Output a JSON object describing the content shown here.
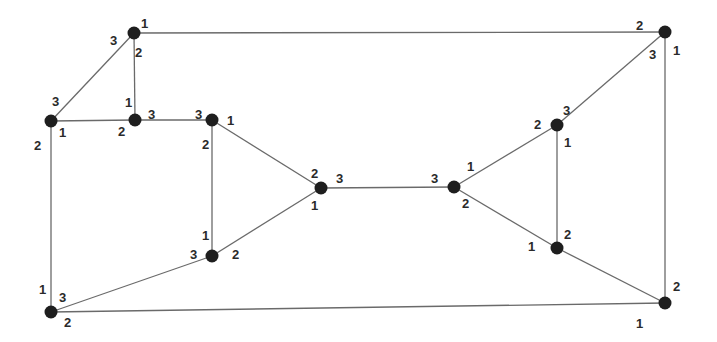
{
  "diagram": {
    "type": "port-numbered graph (3-regular)",
    "colors": {
      "edge": "#6a6a6a",
      "node": "#1e1e1e",
      "label": "#2a2a2a",
      "background": "#ffffff"
    },
    "nodes": [
      {
        "id": "A",
        "x": 134,
        "y": 33
      },
      {
        "id": "B",
        "x": 51,
        "y": 121
      },
      {
        "id": "C",
        "x": 135,
        "y": 120
      },
      {
        "id": "D",
        "x": 212,
        "y": 120
      },
      {
        "id": "E",
        "x": 321,
        "y": 188
      },
      {
        "id": "F",
        "x": 454,
        "y": 187
      },
      {
        "id": "G",
        "x": 557,
        "y": 125
      },
      {
        "id": "H",
        "x": 665,
        "y": 32
      },
      {
        "id": "I",
        "x": 557,
        "y": 248
      },
      {
        "id": "J",
        "x": 665,
        "y": 303
      },
      {
        "id": "K",
        "x": 212,
        "y": 256
      },
      {
        "id": "L",
        "x": 51,
        "y": 312
      }
    ],
    "edges": [
      {
        "from": "A",
        "to": "H"
      },
      {
        "from": "A",
        "to": "B"
      },
      {
        "from": "A",
        "to": "C"
      },
      {
        "from": "B",
        "to": "C"
      },
      {
        "from": "B",
        "to": "L"
      },
      {
        "from": "C",
        "to": "D"
      },
      {
        "from": "D",
        "to": "E"
      },
      {
        "from": "D",
        "to": "K"
      },
      {
        "from": "K",
        "to": "E"
      },
      {
        "from": "K",
        "to": "L"
      },
      {
        "from": "E",
        "to": "F"
      },
      {
        "from": "F",
        "to": "G"
      },
      {
        "from": "F",
        "to": "I"
      },
      {
        "from": "G",
        "to": "H"
      },
      {
        "from": "G",
        "to": "I"
      },
      {
        "from": "H",
        "to": "J"
      },
      {
        "from": "I",
        "to": "J"
      },
      {
        "from": "L",
        "to": "J"
      }
    ],
    "port_labels": [
      {
        "node": "A",
        "text": "1",
        "x": 141,
        "y": 28
      },
      {
        "node": "A",
        "text": "3",
        "x": 110,
        "y": 45
      },
      {
        "node": "A",
        "text": "2",
        "x": 135,
        "y": 57
      },
      {
        "node": "B",
        "text": "3",
        "x": 52,
        "y": 106
      },
      {
        "node": "B",
        "text": "1",
        "x": 59,
        "y": 137
      },
      {
        "node": "B",
        "text": "2",
        "x": 34,
        "y": 150
      },
      {
        "node": "C",
        "text": "1",
        "x": 125,
        "y": 107
      },
      {
        "node": "C",
        "text": "3",
        "x": 148,
        "y": 119
      },
      {
        "node": "C",
        "text": "2",
        "x": 118,
        "y": 136
      },
      {
        "node": "D",
        "text": "3",
        "x": 195,
        "y": 119
      },
      {
        "node": "D",
        "text": "1",
        "x": 227,
        "y": 125
      },
      {
        "node": "D",
        "text": "2",
        "x": 202,
        "y": 149
      },
      {
        "node": "E",
        "text": "2",
        "x": 311,
        "y": 178
      },
      {
        "node": "E",
        "text": "3",
        "x": 336,
        "y": 183
      },
      {
        "node": "E",
        "text": "1",
        "x": 311,
        "y": 210
      },
      {
        "node": "F",
        "text": "3",
        "x": 431,
        "y": 183
      },
      {
        "node": "F",
        "text": "1",
        "x": 467,
        "y": 171
      },
      {
        "node": "F",
        "text": "2",
        "x": 462,
        "y": 208
      },
      {
        "node": "G",
        "text": "2",
        "x": 534,
        "y": 129
      },
      {
        "node": "G",
        "text": "3",
        "x": 563,
        "y": 115
      },
      {
        "node": "G",
        "text": "1",
        "x": 564,
        "y": 147
      },
      {
        "node": "H",
        "text": "2",
        "x": 636,
        "y": 30
      },
      {
        "node": "H",
        "text": "3",
        "x": 649,
        "y": 59
      },
      {
        "node": "H",
        "text": "1",
        "x": 673,
        "y": 55
      },
      {
        "node": "I",
        "text": "2",
        "x": 564,
        "y": 239
      },
      {
        "node": "I",
        "text": "1",
        "x": 528,
        "y": 251
      },
      {
        "node": "J",
        "text": "2",
        "x": 673,
        "y": 291
      },
      {
        "node": "J",
        "text": "1",
        "x": 636,
        "y": 328
      },
      {
        "node": "K",
        "text": "1",
        "x": 202,
        "y": 240
      },
      {
        "node": "K",
        "text": "3",
        "x": 190,
        "y": 259
      },
      {
        "node": "K",
        "text": "2",
        "x": 232,
        "y": 259
      },
      {
        "node": "L",
        "text": "1",
        "x": 39,
        "y": 294
      },
      {
        "node": "L",
        "text": "3",
        "x": 59,
        "y": 302
      },
      {
        "node": "L",
        "text": "2",
        "x": 64,
        "y": 327
      }
    ]
  }
}
